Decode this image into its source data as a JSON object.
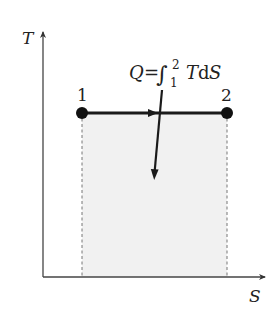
{
  "diagram": {
    "type": "T-S diagram (isothermal heat transfer)",
    "axes": {
      "y_label": "T",
      "x_label": "S"
    },
    "points": [
      {
        "label": "1",
        "x": 82,
        "y": 113
      },
      {
        "label": "2",
        "x": 227,
        "y": 113
      }
    ],
    "process": {
      "from": "1",
      "to": "2",
      "direction": "right"
    },
    "annotation": {
      "Q": "Q",
      "equals": "=",
      "integral": "∫",
      "lower": "1",
      "upper": "2",
      "T": "T",
      "d": "d",
      "S": "S"
    },
    "colors": {
      "line": "#1a1a1a",
      "axis": "#444444",
      "shade": "#f1f1f1",
      "dashed": "#777777"
    }
  }
}
